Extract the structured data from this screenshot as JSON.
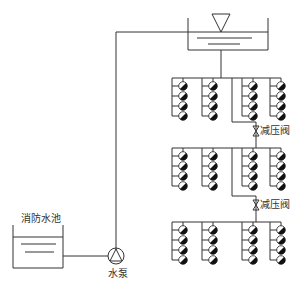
{
  "diagram": {
    "labels": {
      "fire_pool": "消防水池",
      "pump": "水泵",
      "prv_upper": "减压阀",
      "prv_lower": "减压阀"
    },
    "zones": [
      {
        "name": "upper-zone",
        "branches": 4,
        "heads_per_branch": 4
      },
      {
        "name": "middle-zone",
        "branches": 4,
        "heads_per_branch": 4
      },
      {
        "name": "lower-zone",
        "branches": 4,
        "heads_per_branch": 4
      }
    ],
    "components": [
      {
        "type": "elevated-water-tank",
        "icon": "water-level-triangle"
      },
      {
        "type": "fire-pool",
        "icon": "water-level-lines"
      },
      {
        "type": "pump",
        "icon": "pump-circle-triangle"
      },
      {
        "type": "pressure-reducing-valve",
        "count": 2
      }
    ],
    "colors": {
      "line": "#333333",
      "sprinkler_fill": "#111111",
      "background": "#ffffff"
    }
  }
}
